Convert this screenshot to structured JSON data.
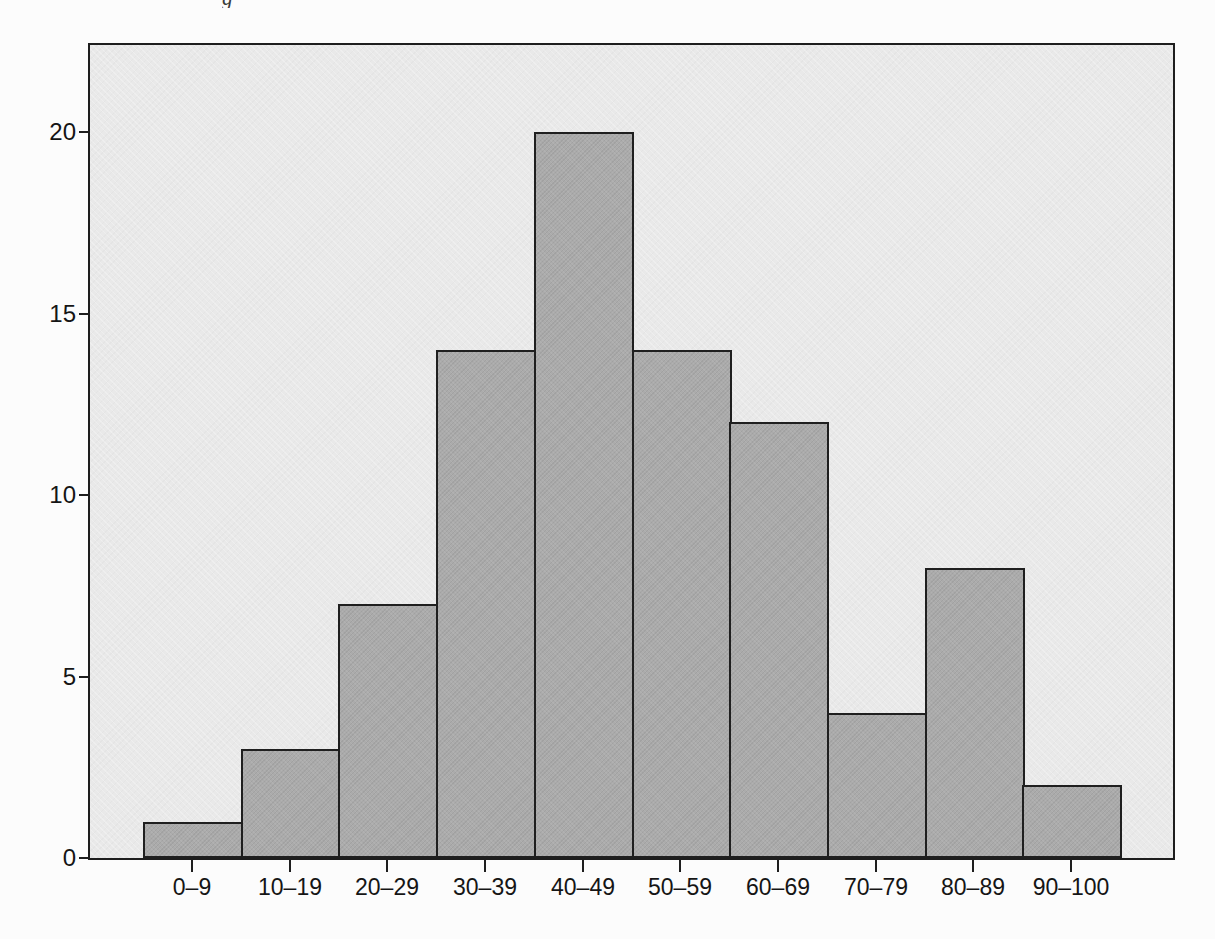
{
  "page": {
    "cropped_caption_fragment": "g"
  },
  "chart_data": {
    "type": "bar",
    "title": "",
    "xlabel": "",
    "ylabel": "",
    "categories": [
      "0–9",
      "10–19",
      "20–29",
      "30–39",
      "40–49",
      "50–59",
      "60–69",
      "70–79",
      "80–89",
      "90–100"
    ],
    "values": [
      1,
      3,
      7,
      14,
      20,
      14,
      12,
      4,
      8,
      2
    ],
    "y_ticks": [
      0,
      5,
      10,
      15,
      20
    ],
    "y_tick_labels": [
      "0",
      "5",
      "10",
      "15",
      "20"
    ],
    "ylim": [
      0,
      22.4
    ],
    "grid": false,
    "legend": false,
    "colors": {
      "page_background": "#fcfcfc",
      "plot_background": "#e9e9e9",
      "bar_fill": "#ababab",
      "bar_border": "#1f1f1f",
      "axis": "#1e1e1e",
      "text": "#151515"
    }
  }
}
